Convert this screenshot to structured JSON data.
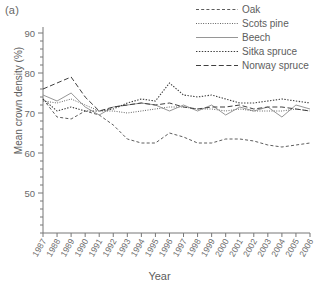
{
  "panel": {
    "label": "(a)"
  },
  "legend": {
    "position": "top-right",
    "entries": [
      {
        "name": "Oak",
        "style": "dashed"
      },
      {
        "name": "Scots pine",
        "style": "fine-dotted"
      },
      {
        "name": "Beech",
        "style": "solid"
      },
      {
        "name": "Sitka spruce",
        "style": "dotted"
      },
      {
        "name": "Norway spruce",
        "style": "long-dashed"
      }
    ]
  },
  "chart_data": {
    "type": "line",
    "title": "",
    "xlabel": "Year",
    "ylabel": "Mean crown density (%)",
    "grid": false,
    "legend_position": "top-right",
    "ylim": [
      40,
      90
    ],
    "yticks": [
      50,
      60,
      70,
      80,
      90
    ],
    "yminor_step": 2,
    "xlim": [
      "1987",
      "2006"
    ],
    "categories": [
      "1987",
      "1988",
      "1989",
      "1990",
      "1991",
      "1992",
      "1993",
      "1994",
      "1995",
      "1996",
      "1997",
      "1998",
      "1999",
      "2000",
      "2001",
      "2002",
      "2003",
      "2004",
      "2005",
      "2006"
    ],
    "series": [
      {
        "name": "Oak",
        "style": "dashed",
        "color": "#4a4a4a",
        "values": [
          73.5,
          69.0,
          68.5,
          70.5,
          69.5,
          67.0,
          63.5,
          62.5,
          62.5,
          65.0,
          64.0,
          62.5,
          62.5,
          63.5,
          63.5,
          63.0,
          62.0,
          61.5,
          62.0,
          62.5
        ]
      },
      {
        "name": "Scots pine",
        "style": "fine-dotted",
        "color": "#555555",
        "values": [
          73.0,
          72.5,
          73.5,
          72.0,
          70.5,
          70.5,
          70.0,
          70.5,
          71.0,
          71.5,
          71.5,
          71.0,
          71.0,
          70.5,
          71.0,
          70.5,
          70.5,
          70.5,
          71.0,
          70.5
        ]
      },
      {
        "name": "Beech",
        "style": "solid",
        "color": "#8a8a8a",
        "values": [
          74.5,
          73.0,
          75.0,
          71.5,
          69.5,
          71.5,
          72.0,
          72.5,
          72.0,
          70.5,
          72.0,
          70.5,
          72.0,
          69.5,
          71.5,
          70.5,
          71.5,
          69.0,
          72.0,
          71.0
        ]
      },
      {
        "name": "Sitka spruce",
        "style": "dotted",
        "color": "#3c3c3c",
        "values": [
          73.5,
          70.5,
          71.5,
          70.5,
          70.5,
          71.0,
          72.5,
          73.5,
          73.0,
          77.5,
          74.5,
          74.0,
          74.5,
          73.5,
          72.5,
          72.5,
          73.0,
          73.5,
          73.0,
          72.5
        ]
      },
      {
        "name": "Norway spruce",
        "style": "long-dashed",
        "color": "#3f3f3f",
        "values": [
          76.0,
          77.5,
          79.0,
          74.0,
          70.5,
          71.5,
          72.0,
          72.5,
          72.0,
          72.5,
          71.5,
          71.0,
          71.5,
          71.5,
          72.0,
          71.0,
          71.5,
          71.5,
          71.0,
          70.5
        ]
      }
    ]
  }
}
